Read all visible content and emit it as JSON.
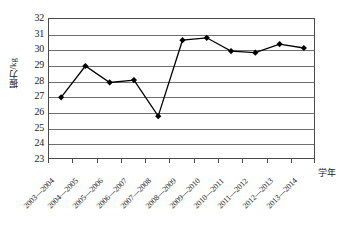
{
  "chart_data": {
    "type": "line",
    "title": "",
    "xlabel": "学年",
    "ylabel": "握力/kg",
    "ylim": [
      23,
      32
    ],
    "ystep": 1,
    "grid": true,
    "legend": false,
    "marker": "diamond",
    "line_color": "#000000",
    "marker_color": "#000000",
    "grid_color": "#6e6e6e",
    "frame_color": "#4a4a4a",
    "yticks": [
      32,
      31,
      30,
      29,
      28,
      27,
      26,
      25,
      24,
      23
    ],
    "categories": [
      "2003—2004",
      "2004—2005",
      "2005—2006",
      "2006—2007",
      "2007—2008",
      "2008—2009",
      "2009—2010",
      "2010—2011",
      "2011—2012",
      "2012—2013",
      "2013—2014"
    ],
    "values": [
      27.0,
      29.0,
      27.95,
      28.1,
      25.8,
      30.65,
      30.8,
      29.95,
      29.85,
      30.4,
      30.15
    ],
    "series": [
      {
        "name": "握力/kg",
        "values": [
          27.0,
          29.0,
          27.95,
          28.1,
          25.8,
          30.65,
          30.8,
          29.95,
          29.85,
          30.4,
          30.15
        ]
      }
    ]
  }
}
